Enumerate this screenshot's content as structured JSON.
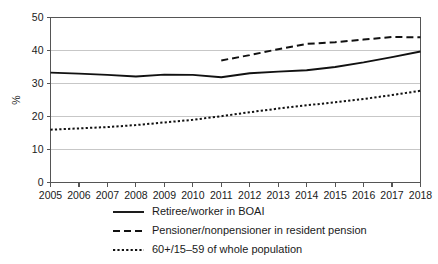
{
  "chart_data": {
    "type": "line",
    "title": "",
    "subtitle": "",
    "xlabel": "",
    "ylabel": "%",
    "xlim": [
      2005,
      2018
    ],
    "ylim": [
      0,
      50
    ],
    "yticks": [
      0,
      10,
      20,
      30,
      40,
      50
    ],
    "ytick_labels": [
      "0",
      "10",
      "20",
      "30",
      "40",
      "50"
    ],
    "grid": true,
    "grid_axis": "y",
    "legend_position": "bottom-center",
    "categories": [
      2005,
      2006,
      2007,
      2008,
      2009,
      2010,
      2011,
      2012,
      2013,
      2014,
      2015,
      2016,
      2017,
      2018
    ],
    "xtick_labels": [
      "2005",
      "2006",
      "2007",
      "2008",
      "2009",
      "2010",
      "2011",
      "2012",
      "2013",
      "2014",
      "2015",
      "2016",
      "2017",
      "2018"
    ],
    "series": [
      {
        "name": "Retiree/worker in BOAI",
        "style": "solid",
        "color": "#111111",
        "x": [
          2005,
          2006,
          2007,
          2008,
          2009,
          2010,
          2011,
          2012,
          2013,
          2014,
          2015,
          2016,
          2017,
          2018
        ],
        "values": [
          33.3,
          33.0,
          32.6,
          32.1,
          32.7,
          32.6,
          31.9,
          33.1,
          33.6,
          34.0,
          35.0,
          36.4,
          38.0,
          39.7
        ]
      },
      {
        "name": "Pensioner/nonpensioner in resident pension",
        "style": "dashed",
        "color": "#111111",
        "x": [
          2011,
          2012,
          2013,
          2014,
          2015,
          2016,
          2017,
          2018
        ],
        "values": [
          37.0,
          38.6,
          40.4,
          42.0,
          42.5,
          43.3,
          44.1,
          44.0
        ]
      },
      {
        "name": "60+/15–59 of whole population",
        "style": "dotted",
        "color": "#111111",
        "x": [
          2005,
          2006,
          2007,
          2008,
          2009,
          2010,
          2011,
          2012,
          2013,
          2014,
          2015,
          2016,
          2017,
          2018
        ],
        "values": [
          16.0,
          16.4,
          16.8,
          17.4,
          18.2,
          19.0,
          20.1,
          21.3,
          22.4,
          23.4,
          24.3,
          25.3,
          26.5,
          27.8
        ]
      }
    ]
  },
  "legend": {
    "items": [
      {
        "label": "Retiree/worker in BOAI",
        "style": "solid"
      },
      {
        "label": "Pensioner/nonpensioner in resident pension",
        "style": "dashed"
      },
      {
        "label": "60+/15–59 of whole population",
        "style": "dotted"
      }
    ]
  }
}
